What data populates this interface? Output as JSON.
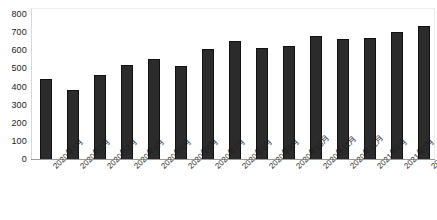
{
  "chart_data": {
    "type": "bar",
    "title": "",
    "subtitle": "",
    "xlabel": "",
    "ylabel": "",
    "categories": [
      "2020年1月",
      "2020年2月",
      "2020年3月",
      "2020年4月",
      "2020年5月",
      "2020年6月",
      "2020年7月",
      "2020年8月",
      "2020年9月",
      "2020年10月",
      "2020年11月",
      "2020年12月",
      "2021年1月",
      "2021年2月",
      "2021年3月"
    ],
    "values": [
      448,
      385,
      470,
      522,
      556,
      518,
      613,
      654,
      620,
      630,
      685,
      670,
      675,
      707,
      740
    ],
    "ylim": [
      0,
      800
    ],
    "ytick_labels": [
      "800",
      "700",
      "600",
      "500",
      "400",
      "300",
      "200",
      "100",
      "0"
    ],
    "ytick_values": [
      800,
      700,
      600,
      500,
      400,
      300,
      200,
      100,
      0
    ],
    "grid": false,
    "legend": null,
    "legend_position": "none",
    "bar_color": "#2b2b2b",
    "bar_edge_color": "#111111",
    "axis_color": "#9a9a9a",
    "background_color": "#ffffff",
    "xtick_rotation": -45
  }
}
